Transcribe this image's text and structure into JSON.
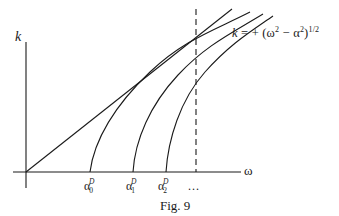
{
  "figure": {
    "caption": "Fig. 9",
    "axes": {
      "y_label": "k",
      "x_label": "ω"
    },
    "formula": {
      "lhs": "k",
      "equals": "=",
      "rhs_prefix": "+ (ω",
      "rhs_exp1": "2",
      "rhs_mid": " − α",
      "rhs_exp2": "2",
      "rhs_close": ")",
      "rhs_exp3": "1/2"
    },
    "cutoff_labels": [
      {
        "base": "α",
        "sub": "0",
        "sup": "D"
      },
      {
        "base": "α",
        "sub": "1",
        "sup": "D"
      },
      {
        "base": "α",
        "sub": "2",
        "sup": "D"
      }
    ],
    "ellipsis": "...",
    "curves": [
      {
        "name": "light-line",
        "type": "straight",
        "description": "k = ω asymptote through origin"
      },
      {
        "name": "branch-0",
        "cutoff": "α0D"
      },
      {
        "name": "branch-1",
        "cutoff": "α1D"
      },
      {
        "name": "branch-2",
        "cutoff": "α2D"
      }
    ],
    "dashed_line": {
      "orientation": "vertical",
      "style": "dashed"
    },
    "colors": {
      "ink": "#1a1a1a",
      "background": "#ffffff"
    }
  }
}
